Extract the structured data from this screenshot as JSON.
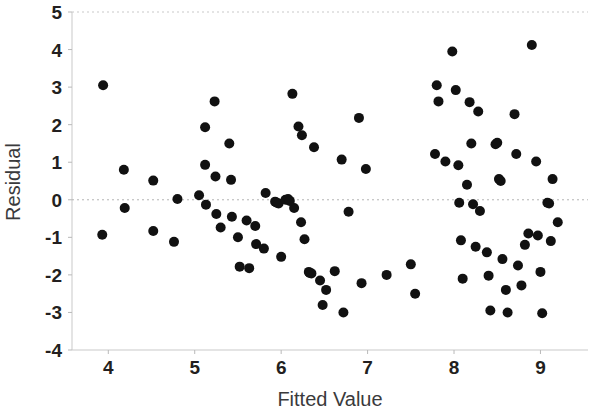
{
  "chart_data": {
    "type": "scatter",
    "title": "",
    "subtitle": "",
    "xlabel": "Fitted Value",
    "ylabel": "Residual",
    "xlim": [
      3.58,
      9.55
    ],
    "ylim": [
      -4,
      5
    ],
    "xticks": [
      4,
      5,
      6,
      7,
      8,
      9
    ],
    "yticks": [
      5,
      4,
      3,
      2,
      1,
      0,
      -1,
      -2,
      -3,
      -4
    ],
    "xtick_labels": [
      "4",
      "5",
      "6",
      "7",
      "8",
      "9"
    ],
    "ytick_labels": [
      "5",
      "4",
      "3",
      "2",
      "1",
      "0",
      "-1",
      "-2",
      "-3",
      "-4"
    ],
    "grid": false,
    "legend": null,
    "reference_lines": [
      {
        "orientation": "horizontal",
        "value": 0,
        "style": "dashed",
        "color": "#b5b5b5"
      }
    ],
    "marker": {
      "shape": "circle",
      "color": "#111111",
      "size": 5
    },
    "n_points": 100,
    "points": [
      [
        3.94,
        3.05
      ],
      [
        3.93,
        -0.93
      ],
      [
        4.18,
        0.8
      ],
      [
        4.19,
        -0.22
      ],
      [
        4.52,
        0.51
      ],
      [
        4.52,
        -0.83
      ],
      [
        4.76,
        -1.12
      ],
      [
        5.12,
        1.93
      ],
      [
        5.12,
        0.93
      ],
      [
        5.13,
        -0.13
      ],
      [
        5.23,
        2.62
      ],
      [
        5.24,
        0.62
      ],
      [
        5.25,
        -0.38
      ],
      [
        5.3,
        -0.74
      ],
      [
        5.4,
        1.5
      ],
      [
        5.42,
        0.53
      ],
      [
        5.43,
        -0.45
      ],
      [
        5.5,
        -1.0
      ],
      [
        5.52,
        -1.78
      ],
      [
        5.63,
        -1.82
      ],
      [
        5.7,
        -0.7
      ],
      [
        5.71,
        -1.18
      ],
      [
        5.8,
        -1.3
      ],
      [
        5.82,
        0.18
      ],
      [
        5.93,
        -0.05
      ],
      [
        5.95,
        -0.08
      ],
      [
        5.97,
        -0.1
      ],
      [
        6.0,
        -1.52
      ],
      [
        6.13,
        2.82
      ],
      [
        6.15,
        -0.22
      ],
      [
        6.2,
        1.95
      ],
      [
        6.23,
        -0.6
      ],
      [
        6.24,
        1.72
      ],
      [
        6.32,
        -1.92
      ],
      [
        6.33,
        -1.95
      ],
      [
        6.35,
        -1.96
      ],
      [
        6.38,
        1.4
      ],
      [
        6.45,
        -2.15
      ],
      [
        6.48,
        -2.8
      ],
      [
        6.62,
        -1.9
      ],
      [
        6.7,
        1.07
      ],
      [
        6.72,
        -3.0
      ],
      [
        6.78,
        -0.32
      ],
      [
        6.9,
        2.18
      ],
      [
        6.93,
        -2.22
      ],
      [
        6.98,
        0.82
      ],
      [
        7.5,
        -1.72
      ],
      [
        7.55,
        -2.5
      ],
      [
        7.78,
        1.22
      ],
      [
        7.8,
        3.05
      ],
      [
        7.82,
        2.62
      ],
      [
        7.9,
        1.02
      ],
      [
        7.98,
        3.95
      ],
      [
        8.02,
        2.92
      ],
      [
        8.05,
        0.92
      ],
      [
        8.06,
        -0.08
      ],
      [
        8.08,
        -1.08
      ],
      [
        8.1,
        -2.1
      ],
      [
        8.18,
        2.6
      ],
      [
        8.2,
        1.5
      ],
      [
        8.22,
        -0.12
      ],
      [
        8.25,
        -1.25
      ],
      [
        8.28,
        2.35
      ],
      [
        8.3,
        -0.3
      ],
      [
        8.38,
        -1.4
      ],
      [
        8.4,
        -2.02
      ],
      [
        8.42,
        -2.95
      ],
      [
        8.48,
        1.48
      ],
      [
        8.5,
        1.52
      ],
      [
        8.52,
        0.55
      ],
      [
        8.54,
        0.5
      ],
      [
        8.56,
        -1.58
      ],
      [
        8.6,
        -2.4
      ],
      [
        8.62,
        -3.0
      ],
      [
        8.7,
        2.28
      ],
      [
        8.72,
        1.22
      ],
      [
        8.74,
        -1.75
      ],
      [
        8.78,
        -2.28
      ],
      [
        8.86,
        -0.9
      ],
      [
        8.9,
        4.12
      ],
      [
        8.95,
        1.02
      ],
      [
        8.97,
        -0.95
      ],
      [
        9.0,
        -1.92
      ],
      [
        9.02,
        -3.02
      ],
      [
        9.08,
        -0.08
      ],
      [
        9.1,
        -0.1
      ],
      [
        9.12,
        -1.1
      ],
      [
        9.14,
        0.55
      ],
      [
        4.8,
        0.02
      ],
      [
        6.05,
        0.0
      ],
      [
        6.08,
        0.02
      ],
      [
        6.1,
        -0.03
      ],
      [
        5.6,
        -0.55
      ],
      [
        6.52,
        -2.4
      ],
      [
        7.22,
        -2.0
      ],
      [
        8.15,
        0.4
      ],
      [
        8.82,
        -1.2
      ],
      [
        9.2,
        -0.6
      ],
      [
        5.05,
        0.12
      ],
      [
        6.27,
        -1.05
      ]
    ]
  },
  "axes": {
    "x_title": "Fitted Value",
    "y_title": "Residual"
  }
}
